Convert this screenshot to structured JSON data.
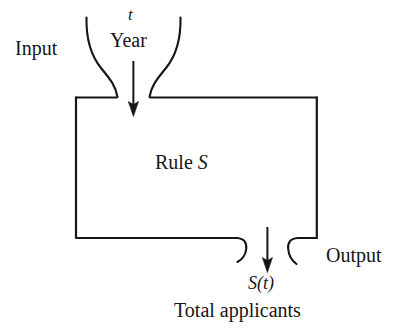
{
  "figure": {
    "type": "function-machine-diagram",
    "background_color": "#ffffff",
    "stroke_color": "#161616",
    "labels": {
      "input": "Input",
      "variable": "t",
      "variable_meaning": "Year",
      "rule_prefix": "Rule ",
      "rule_symbol": "S",
      "output": "Output",
      "output_expression": "S(t)",
      "output_meaning": "Total applicants"
    },
    "parts": {
      "funnel": "input-funnel",
      "box": "rule-box",
      "input_arrow": "downward-arrow-into-box",
      "output_arrow": "downward-arrow-out-of-box",
      "output_spout": "output-spout"
    }
  }
}
